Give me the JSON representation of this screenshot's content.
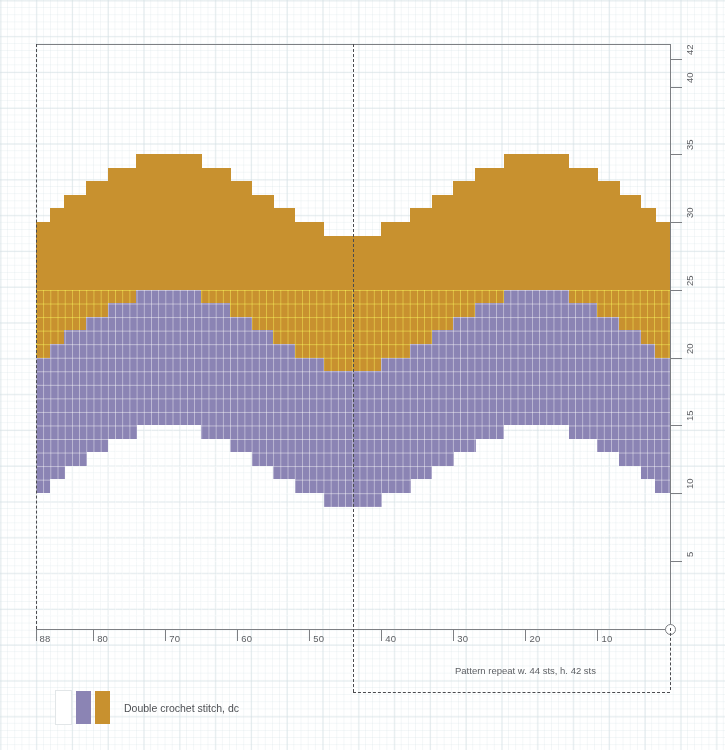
{
  "chart_data": {
    "type": "heatmap",
    "title": "",
    "xlabel": "",
    "ylabel": "",
    "grid": true,
    "legend_position": "bottom-left",
    "columns": 88,
    "rows": 42,
    "x_axis": {
      "direction": "right-to-left",
      "min": 1,
      "max": 88,
      "tick_labels": [
        "88",
        "80",
        "70",
        "60",
        "50",
        "40",
        "30",
        "20",
        "10"
      ],
      "tick_values": [
        88,
        80,
        70,
        60,
        50,
        40,
        30,
        20,
        10
      ]
    },
    "y_axis": {
      "direction": "bottom-to-top",
      "min": 1,
      "max": 42,
      "tick_labels": [
        "5",
        "10",
        "15",
        "20",
        "25",
        "30",
        "35",
        "40",
        "42"
      ],
      "tick_values": [
        5,
        10,
        15,
        20,
        25,
        30,
        35,
        40,
        42
      ]
    },
    "colors": {
      "gold": "#c8912f",
      "purple": "#8b84b4",
      "empty": "#ffffff",
      "axis": "#7d7f83",
      "dash": "#4a4b4f",
      "paper": "#d2dee2"
    },
    "series": [
      {
        "name": "Double crochet stitch, dc — colour A (empty/background)",
        "color": "#ffffff"
      },
      {
        "name": "Double crochet stitch, dc — colour B",
        "color": "#8b84b4"
      },
      {
        "name": "Double crochet stitch, dc — colour C",
        "color": "#c8912f"
      }
    ],
    "band_profiles": {
      "comment": "Per-column stitch-row boundaries, listed for column index 1..88 counted from the LEFT edge of the chart. gold_top = highest row filled with gold; purple_top = highest row filled with purple; purple_bottom = lowest row filled with purple. Rows below purple_bottom are empty.",
      "gold_top": [
        30,
        30,
        31,
        31,
        32,
        32,
        32,
        33,
        33,
        33,
        34,
        34,
        34,
        34,
        35,
        35,
        35,
        35,
        35,
        35,
        35,
        35,
        35,
        34,
        34,
        34,
        34,
        33,
        33,
        33,
        32,
        32,
        32,
        31,
        31,
        31,
        30,
        30,
        30,
        30,
        29,
        29,
        29,
        29,
        29,
        29,
        29,
        29,
        30,
        30,
        30,
        30,
        31,
        31,
        31,
        32,
        32,
        32,
        33,
        33,
        33,
        34,
        34,
        34,
        34,
        35,
        35,
        35,
        35,
        35,
        35,
        35,
        35,
        35,
        34,
        34,
        34,
        34,
        33,
        33,
        33,
        32,
        32,
        32,
        31,
        31,
        30,
        30
      ],
      "purple_top": [
        20,
        20,
        21,
        21,
        22,
        22,
        22,
        23,
        23,
        23,
        24,
        24,
        24,
        24,
        25,
        25,
        25,
        25,
        25,
        25,
        25,
        25,
        25,
        24,
        24,
        24,
        24,
        23,
        23,
        23,
        22,
        22,
        22,
        21,
        21,
        21,
        20,
        20,
        20,
        20,
        19,
        19,
        19,
        19,
        19,
        19,
        19,
        19,
        20,
        20,
        20,
        20,
        21,
        21,
        21,
        22,
        22,
        22,
        23,
        23,
        23,
        24,
        24,
        24,
        24,
        25,
        25,
        25,
        25,
        25,
        25,
        25,
        25,
        25,
        24,
        24,
        24,
        24,
        23,
        23,
        23,
        22,
        22,
        22,
        21,
        21,
        20,
        20
      ],
      "purple_bottom": [
        10,
        10,
        11,
        11,
        12,
        12,
        12,
        13,
        13,
        13,
        14,
        14,
        14,
        14,
        15,
        15,
        15,
        15,
        15,
        15,
        15,
        15,
        15,
        14,
        14,
        14,
        14,
        13,
        13,
        13,
        12,
        12,
        12,
        11,
        11,
        11,
        10,
        10,
        10,
        10,
        9,
        9,
        9,
        9,
        9,
        9,
        9,
        9,
        10,
        10,
        10,
        10,
        11,
        11,
        11,
        12,
        12,
        12,
        13,
        13,
        13,
        14,
        14,
        14,
        14,
        15,
        15,
        15,
        15,
        15,
        15,
        15,
        15,
        15,
        14,
        14,
        14,
        14,
        13,
        13,
        13,
        12,
        12,
        12,
        11,
        11,
        10,
        10
      ]
    }
  },
  "legend": {
    "swatches": [
      "empty-white",
      "purple",
      "gold"
    ],
    "label": "Double crochet stitch, dc"
  },
  "annotations": {
    "pattern_repeat": "Pattern repeat w. 44 sts, h. 42 sts"
  }
}
